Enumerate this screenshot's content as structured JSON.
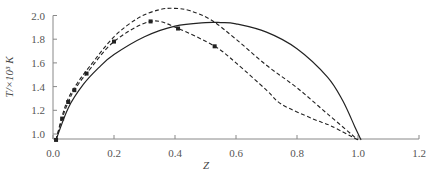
{
  "chart_data": {
    "type": "line",
    "title": "",
    "xlabel": "Z",
    "ylabel": "T/×10³ K",
    "xlim": [
      0.0,
      1.2
    ],
    "ylim": [
      0.96,
      2.05
    ],
    "x_ticks": [
      "0.0",
      "0.2",
      "0.4",
      "0.6",
      "0.8",
      "1.0",
      "1.2"
    ],
    "y_ticks": [
      "1.0",
      "1.2",
      "1.4",
      "1.6",
      "1.8",
      "2.0"
    ],
    "grid": false,
    "legend": null,
    "series": [
      {
        "name": "solid curve",
        "style": "solid",
        "markers": false,
        "x": [
          0.01,
          0.05,
          0.1,
          0.15,
          0.2,
          0.3,
          0.4,
          0.5,
          0.55,
          0.6,
          0.7,
          0.8,
          0.9,
          0.95,
          0.99,
          1.01
        ],
        "y": [
          0.95,
          1.22,
          1.42,
          1.56,
          1.67,
          1.82,
          1.91,
          1.94,
          1.94,
          1.93,
          1.86,
          1.72,
          1.48,
          1.28,
          1.06,
          0.95
        ]
      },
      {
        "name": "upper dashed curve",
        "style": "dashed",
        "markers": false,
        "x": [
          0.01,
          0.03,
          0.05,
          0.08,
          0.12,
          0.2,
          0.28,
          0.35,
          0.4,
          0.45,
          0.52,
          0.6,
          0.7,
          0.8,
          0.9,
          1.0
        ],
        "y": [
          0.95,
          1.15,
          1.3,
          1.43,
          1.57,
          1.82,
          1.98,
          2.05,
          2.06,
          2.04,
          1.96,
          1.8,
          1.58,
          1.39,
          1.17,
          0.95
        ]
      },
      {
        "name": "lower dashed curve with markers",
        "style": "dashed",
        "markers": true,
        "x": [
          0.01,
          0.03,
          0.05,
          0.07,
          0.11,
          0.2,
          0.32,
          0.41,
          0.53,
          0.6,
          0.7,
          0.75,
          0.85,
          0.91,
          1.0
        ],
        "y": [
          0.95,
          1.13,
          1.27,
          1.37,
          1.51,
          1.78,
          1.95,
          1.89,
          1.74,
          1.6,
          1.37,
          1.25,
          1.13,
          1.07,
          0.95
        ],
        "marker_x": [
          0.01,
          0.03,
          0.05,
          0.07,
          0.11,
          0.2,
          0.32,
          0.41,
          0.53
        ],
        "marker_y": [
          0.95,
          1.13,
          1.27,
          1.37,
          1.51,
          1.78,
          1.95,
          1.89,
          1.74
        ]
      }
    ],
    "colors": {
      "axis": "#888888",
      "line": "#222222",
      "text": "#555555"
    }
  }
}
